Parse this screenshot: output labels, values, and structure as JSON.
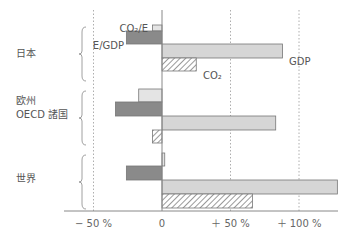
{
  "chart_data": {
    "type": "bar",
    "orientation": "horizontal",
    "title": "",
    "xlabel": "",
    "ylabel": "",
    "xlim": [
      -70,
      135
    ],
    "grid": true,
    "grid_style": "dotted vertical lines at -50, +50, +100",
    "x_ticks": [
      {
        "value": -50,
        "label": "− 50 %"
      },
      {
        "value": 0,
        "label": "0"
      },
      {
        "value": 50,
        "label": "＋ 50 %"
      },
      {
        "value": 100,
        "label": "＋ 100 %"
      }
    ],
    "categories": [
      "日本",
      "欧州\nOECD 諸国",
      "世界"
    ],
    "category_labels": [
      [
        "日本"
      ],
      [
        "欧州",
        "OECD 諸国"
      ],
      [
        "世界"
      ]
    ],
    "series": [
      {
        "name": "CO2/E",
        "label": "CO₂/E",
        "fill": "#e4e4e4",
        "pattern": "solid-light",
        "values": [
          -7,
          -17,
          2
        ]
      },
      {
        "name": "E/GDP",
        "label": "E/GDP",
        "fill": "#8a8a8a",
        "pattern": "solid-dark",
        "values": [
          -26,
          -34,
          -26
        ]
      },
      {
        "name": "GDP",
        "label": "GDP",
        "fill": "#d6d6d6",
        "pattern": "solid-mid",
        "values": [
          88,
          83,
          128
        ]
      },
      {
        "name": "CO2",
        "label": "CO₂",
        "fill": "#ffffff",
        "pattern": "hatched",
        "values": [
          25,
          -7,
          66
        ]
      }
    ],
    "annotations": [
      {
        "text": "CO₂/E",
        "target": "日本 CO2/E bar"
      },
      {
        "text": "E/GDP",
        "target": "日本 E/GDP bar"
      },
      {
        "text": "GDP",
        "target": "日本 GDP bar"
      },
      {
        "text": "CO₂",
        "target": "日本 CO2 bar"
      }
    ],
    "legend": "inline annotations on 日本 group"
  },
  "colors": {
    "axis": "#888888",
    "grid": "#999999",
    "bar_stroke": "#777777",
    "text": "#555555"
  }
}
